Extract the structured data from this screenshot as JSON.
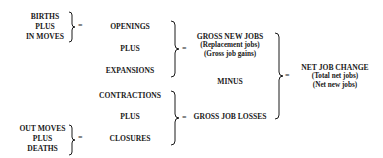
{
  "diagram": {
    "left_top": {
      "line1": "BIRTHS",
      "line2": "PLUS",
      "line3": "IN MOVES"
    },
    "left_bottom": {
      "line1": "OUT MOVES",
      "line2": "PLUS",
      "line3": "DEATHS"
    },
    "col2": {
      "openings": "OPENINGS",
      "plus1": "PLUS",
      "expansions": "EXPANSIONS",
      "contractions": "CONTRACTIONS",
      "plus2": "PLUS",
      "closures": "CLOSURES"
    },
    "col3": {
      "gross_new_jobs": "GROSS NEW JOBS",
      "gnj_alias1": "(Replacement jobs)",
      "gnj_alias2": "(Gross job gains)",
      "minus": "MINUS",
      "gross_job_losses": "GROSS JOB LOSSES"
    },
    "col4": {
      "net_job_change": "NET JOB CHANGE",
      "njc_alias1": "(Total net jobs)",
      "njc_alias2": "(Net new jobs)"
    },
    "equals": "="
  }
}
